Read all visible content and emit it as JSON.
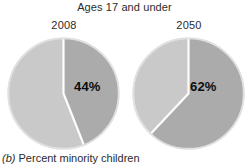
{
  "chart_data": {
    "type": "pie",
    "title": "Ages 17 and under",
    "caption_tag": "(b)",
    "caption_text": " Percent minority children",
    "xlabel": "",
    "ylabel": "",
    "legend_position": "none",
    "grid": false,
    "colors": {
      "minority_slice": "#ababab",
      "nonminority_slice": "#c9c9c9",
      "separator": "#fdfdfd",
      "outline": "#e2e2e2",
      "background": "#ffffff",
      "text": "#2b2b2b",
      "value_text": "#0d0d0d"
    },
    "charts": [
      {
        "name": "2008",
        "year_label": "2008",
        "labels": [
          "Minority",
          "Non-minority"
        ],
        "values": [
          44,
          56
        ],
        "value_label": "44%",
        "value_label_unit": "%",
        "minority_percent": 44,
        "nonminority_percent": 56,
        "start_angle_deg": 0,
        "sweep_deg": 158.4
      },
      {
        "name": "2050",
        "year_label": "2050",
        "labels": [
          "Minority",
          "Non-minority"
        ],
        "values": [
          62,
          38
        ],
        "value_label": "62%",
        "value_label_unit": "%",
        "minority_percent": 62,
        "nonminority_percent": 38,
        "start_angle_deg": 0,
        "sweep_deg": 223.2
      }
    ]
  }
}
